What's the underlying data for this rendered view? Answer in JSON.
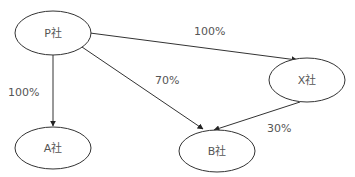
{
  "diagram": {
    "nodes": [
      {
        "id": "P",
        "label": "P社",
        "cx": 53,
        "cy": 33,
        "rx": 38,
        "ry": 22
      },
      {
        "id": "A",
        "label": "A社",
        "cx": 53,
        "cy": 148,
        "rx": 38,
        "ry": 21
      },
      {
        "id": "B",
        "label": "B社",
        "cx": 217,
        "cy": 151,
        "rx": 38,
        "ry": 21
      },
      {
        "id": "X",
        "label": "X社",
        "cx": 307,
        "cy": 80,
        "rx": 38,
        "ry": 22
      }
    ],
    "edges": [
      {
        "from": "P",
        "to": "A",
        "label": "100%"
      },
      {
        "from": "P",
        "to": "B",
        "label": "70%"
      },
      {
        "from": "P",
        "to": "X",
        "label": "100%"
      },
      {
        "from": "X",
        "to": "B",
        "label": "30%"
      }
    ],
    "colors": {
      "stroke": "#333333",
      "text": "#555555",
      "background": "#ffffff"
    }
  }
}
